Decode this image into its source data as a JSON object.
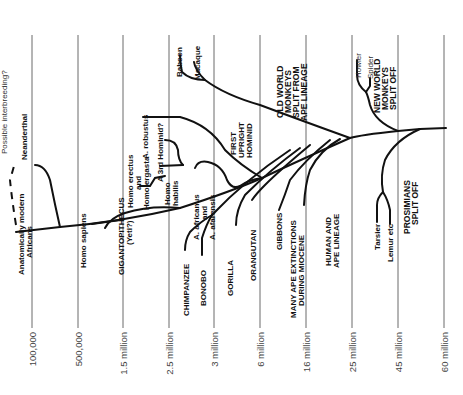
{
  "timeline": {
    "ticks": [
      "100,000",
      "500,000",
      "1.5 million",
      "2.5 million",
      "3 million",
      "6 million",
      "16 million",
      "25 million",
      "45 million",
      "60 million"
    ]
  },
  "labels": {
    "possible_interbreeding": "Possible interbreeding?",
    "neanderthal": "Neanderthal",
    "modern_africans_1": "Anatomically modern",
    "modern_africans_2": "Africans",
    "homo_sapiens": "Homo sapiens",
    "homo_erectus_1": "Homo erectus",
    "homo_erectus_2": "and",
    "homo_erectus_3": "Homo ergasta",
    "gigantopithecus_1": "GIGANTOPITHECUS",
    "gigantopithecus_2": "(Yeti?)",
    "a_robustus": "A. robustus",
    "third_hominid": "A 3rd Hominid?",
    "homo_habilis_1": "Homo",
    "homo_habilis_2": "habilis",
    "a_africanus_1": "A. africanus",
    "a_africanus_2": "and",
    "a_africanus_3": "A. afarensis",
    "first_upright_1": "FIRST",
    "first_upright_2": "UPRIGHT",
    "first_upright_3": "HOMINID",
    "baboon": "Baboon",
    "macaque": "Macaque",
    "old_world_1": "OLD WORLD",
    "old_world_2": "MONKEYS",
    "old_world_3": "SPLIT FROM",
    "old_world_4": "APE LINEAGE",
    "howler": "Howler",
    "spider": "Spider",
    "new_world_1": "NEW WORLD",
    "new_world_2": "MONKEYS",
    "new_world_3": "SPLIT OFF",
    "chimpanzee": "CHIMPANZEE",
    "bonobo": "BONOBO",
    "gorilla": "GORILLA",
    "orangutan": "ORANGUTAN",
    "gibbons": "GIBBONS",
    "ape_extinctions_1": "MANY APE EXTINCTIONS",
    "ape_extinctions_2": "DURING MIOCENE",
    "human_ape_1": "HUMAN AND",
    "human_ape_2": "APE LINEAGE",
    "tarsier": "Tarsier",
    "lemur": "Lemur etc",
    "prosimians_1": "PROSIMIANS",
    "prosimians_2": "SPLIT OFF"
  }
}
